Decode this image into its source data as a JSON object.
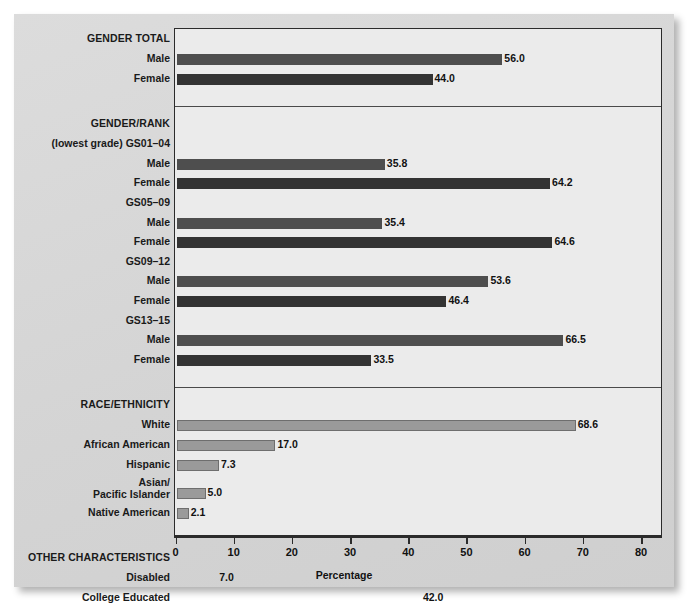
{
  "chart_data": {
    "type": "bar",
    "orientation": "horizontal",
    "title": "",
    "xlabel": "Percentage",
    "ylabel": "",
    "xlim": [
      0,
      80
    ],
    "xticks": [
      0,
      10,
      20,
      30,
      40,
      50,
      60,
      70,
      80
    ],
    "xtick_labels": [
      "0",
      "10",
      "20",
      "30",
      "40",
      "50",
      "60",
      "70",
      "80"
    ],
    "grid": false,
    "legend": "none",
    "value_label_format": "one-decimal",
    "sections": [
      {
        "heading": "GENDER TOTAL",
        "subgroups": [
          {
            "label": "",
            "rows": [
              {
                "category": "Male",
                "value": 56.0,
                "label": "56.0",
                "style": "male"
              },
              {
                "category": "Female",
                "value": 44.0,
                "label": "44.0",
                "style": "female"
              }
            ]
          }
        ]
      },
      {
        "heading": "GENDER/RANK",
        "subgroups": [
          {
            "label": "(lowest grade) GS01–04",
            "rows": [
              {
                "category": "Male",
                "value": 35.8,
                "label": "35.8",
                "style": "male"
              },
              {
                "category": "Female",
                "value": 64.2,
                "label": "64.2",
                "style": "female"
              }
            ]
          },
          {
            "label": "GS05–09",
            "rows": [
              {
                "category": "Male",
                "value": 35.4,
                "label": "35.4",
                "style": "male"
              },
              {
                "category": "Female",
                "value": 64.6,
                "label": "64.6",
                "style": "female"
              }
            ]
          },
          {
            "label": "GS09–12",
            "rows": [
              {
                "category": "Male",
                "value": 53.6,
                "label": "53.6",
                "style": "male"
              },
              {
                "category": "Female",
                "value": 46.4,
                "label": "46.4",
                "style": "female"
              }
            ]
          },
          {
            "label": "GS13–15",
            "rows": [
              {
                "category": "Male",
                "value": 66.5,
                "label": "66.5",
                "style": "male"
              },
              {
                "category": "Female",
                "value": 33.5,
                "label": "33.5",
                "style": "female"
              }
            ]
          }
        ]
      },
      {
        "heading": "RACE/ETHNICITY",
        "subgroups": [
          {
            "label": "",
            "rows": [
              {
                "category": "White",
                "value": 68.6,
                "label": "68.6",
                "style": "race"
              },
              {
                "category": "African American",
                "value": 17.0,
                "label": "17.0",
                "style": "race"
              },
              {
                "category": "Hispanic",
                "value": 7.3,
                "label": "7.3",
                "style": "race"
              },
              {
                "category": "Asian/\nPacific Islander",
                "value": 5.0,
                "label": "5.0",
                "style": "race"
              },
              {
                "category": "Native American",
                "value": 2.1,
                "label": "2.1",
                "style": "race"
              }
            ]
          }
        ]
      },
      {
        "heading": "OTHER CHARACTERISTICS",
        "subgroups": [
          {
            "label": "",
            "rows": [
              {
                "category": "Disabled",
                "value": 7.0,
                "label": "7.0",
                "style": "other"
              },
              {
                "category": "College Educated",
                "value": 42.0,
                "label": "42.0",
                "style": "other"
              },
              {
                "category": "Veterans",
                "value": 22.0,
                "label": "22.0",
                "style": "other"
              }
            ]
          }
        ]
      }
    ],
    "colors": {
      "male_bar": "#4e4e4e",
      "female_bar": "#333333",
      "race_bar": "#9a9a9a",
      "other_bar": "#2e2e2e",
      "plot_background": "#ebebeb",
      "card_background": "#d8d8d8",
      "axis": "#2b2b2b"
    },
    "layout": {
      "section_headings": [
        "GENDER TOTAL",
        "GENDER/RANK",
        "RACE/ETHNICITY",
        "OTHER CHARACTERISTICS"
      ],
      "section_separator_count": 3
    }
  }
}
